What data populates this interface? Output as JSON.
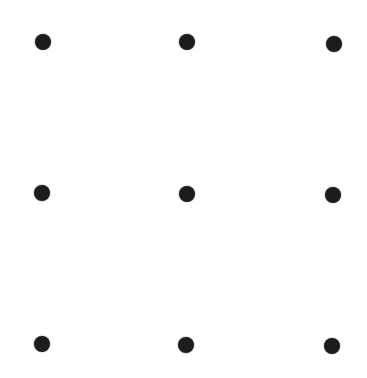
{
  "canvas": {
    "width": 367,
    "height": 378,
    "background": "#ffffff"
  },
  "grid": {
    "rows": 3,
    "cols": 3,
    "dot_color": "#1c1c1c",
    "dot_radius": 8,
    "dots": [
      {
        "row": 0,
        "col": 0,
        "x": 43,
        "y": 42
      },
      {
        "row": 0,
        "col": 1,
        "x": 187,
        "y": 42
      },
      {
        "row": 0,
        "col": 2,
        "x": 334,
        "y": 44
      },
      {
        "row": 1,
        "col": 0,
        "x": 42,
        "y": 193
      },
      {
        "row": 1,
        "col": 1,
        "x": 187,
        "y": 194
      },
      {
        "row": 1,
        "col": 2,
        "x": 333,
        "y": 195
      },
      {
        "row": 2,
        "col": 0,
        "x": 42,
        "y": 344
      },
      {
        "row": 2,
        "col": 1,
        "x": 186,
        "y": 345
      },
      {
        "row": 2,
        "col": 2,
        "x": 332,
        "y": 346
      }
    ]
  }
}
